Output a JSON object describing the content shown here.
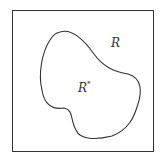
{
  "diagram": {
    "outer_region_label": "R",
    "inner_region_label": "R",
    "inner_region_superscript": "*",
    "stroke_color": "#333333",
    "background_color": "#ffffff"
  }
}
